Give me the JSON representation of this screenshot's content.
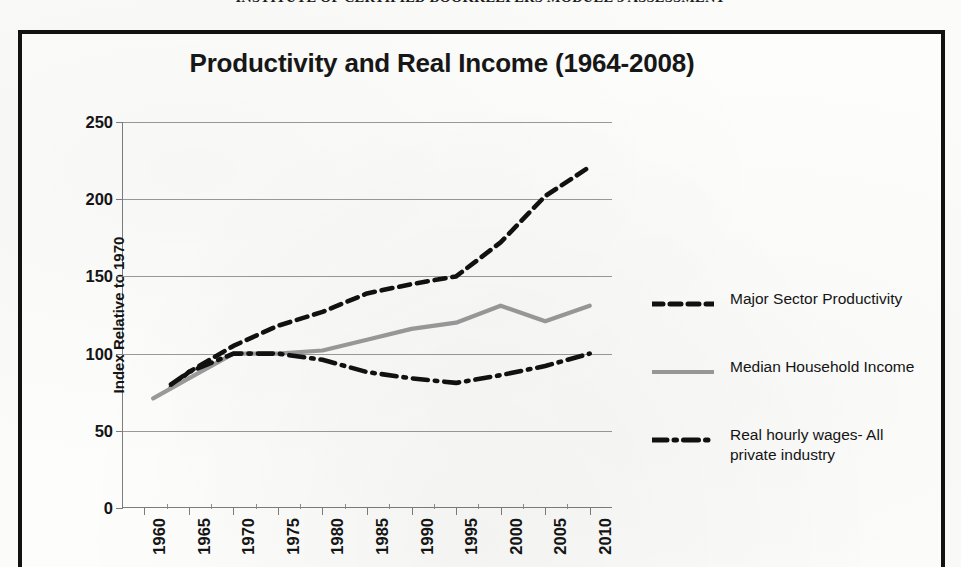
{
  "page": {
    "header_line": "INSTITUTE OF CERTIFIED BOOKKEEPERS MODULE 3 ASSESSMENT"
  },
  "chart_data": {
    "type": "line",
    "title": "Productivity and Real Income (1964-2008)",
    "xlabel": "",
    "ylabel": "Index Relative to 1970",
    "ylim": [
      0,
      250
    ],
    "yticks": [
      0,
      50,
      100,
      150,
      200,
      250
    ],
    "grid": true,
    "legend_position": "right",
    "categories": [
      1960,
      1965,
      1970,
      1975,
      1980,
      1985,
      1990,
      1995,
      2000,
      2005,
      2010
    ],
    "xticklabels": [
      "1960",
      "1965",
      "1970",
      "1975",
      "1980",
      "1985",
      "1990",
      "1995",
      "2000",
      "2005",
      "2010"
    ],
    "series": [
      {
        "name": "Major Sector Productivity",
        "style": "dashed",
        "color": "#111111",
        "x": [
          1963,
          1965,
          1970,
          1975,
          1980,
          1985,
          1990,
          1995,
          2000,
          2005,
          2010
        ],
        "values": [
          78,
          88,
          105,
          118,
          127,
          139,
          145,
          150,
          172,
          202,
          221
        ]
      },
      {
        "name": "Median Household Income",
        "style": "solid",
        "color": "#9b9b9b",
        "x": [
          1961,
          1965,
          1970,
          1975,
          1980,
          1985,
          1990,
          1995,
          2000,
          2005,
          2010
        ],
        "values": [
          71,
          84,
          100,
          100,
          102,
          109,
          116,
          120,
          131,
          121,
          131
        ]
      },
      {
        "name": "Real hourly wages- All private industry",
        "style": "dash-dot",
        "color": "#111111",
        "x": [
          1963,
          1965,
          1970,
          1975,
          1980,
          1985,
          1990,
          1995,
          2000,
          2005,
          2010
        ],
        "values": [
          80,
          88,
          100,
          100,
          96,
          88,
          84,
          81,
          86,
          92,
          100
        ]
      }
    ]
  },
  "legend": {
    "items": [
      {
        "label": "Major Sector Productivity",
        "style": "dashed",
        "color": "#111111"
      },
      {
        "label": "Median Household Income",
        "style": "solid",
        "color": "#9b9b9b"
      },
      {
        "label": "Real hourly wages- All\nprivate industry",
        "style": "dash-dot",
        "color": "#111111"
      }
    ]
  }
}
